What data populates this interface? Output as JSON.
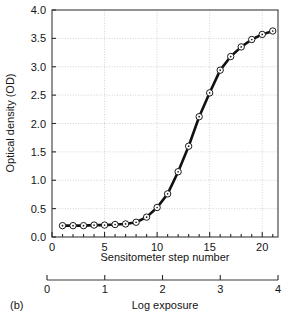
{
  "panel": {
    "label": "(b)"
  },
  "chart_data": {
    "type": "line",
    "title": "",
    "subtitle": "",
    "xlabel": "Sensitometer step number",
    "ylabel": "Optical density (OD)",
    "secondary_xlabel": "Log exposure",
    "xlim": [
      0,
      21.5
    ],
    "ylim": [
      0,
      4.0
    ],
    "secondary_xlim": [
      0,
      4
    ],
    "grid": true,
    "grid_style": "dotted",
    "grid_color": "#c8c8c8",
    "legend": false,
    "legend_position": "none",
    "marker": "circle-with-center-dot",
    "marker_facecolor": "#ffffff",
    "marker_edgecolor": "#1a1a1a",
    "line_color": "#111111",
    "line_width": 2.6,
    "y_ticks": [
      0.0,
      0.5,
      1.0,
      1.5,
      2.0,
      2.5,
      3.0,
      3.5,
      4.0
    ],
    "y_tick_labels": [
      "0.0",
      "0.5",
      "1.0",
      "1.5",
      "2.0",
      "2.5",
      "3.0",
      "3.5",
      "4.0"
    ],
    "x_ticks": [
      0,
      5,
      10,
      15,
      20
    ],
    "x_tick_labels": [
      "0",
      "5",
      "10",
      "15",
      "20"
    ],
    "x_minor_tick_interval": 1,
    "secondary_x_ticks": [
      0,
      1,
      2,
      3,
      4
    ],
    "secondary_x_tick_labels": [
      "0",
      "1",
      "2",
      "3",
      "4"
    ],
    "x": [
      1,
      2,
      3,
      4,
      5,
      6,
      7,
      8,
      9,
      10,
      11,
      12,
      13,
      14,
      15,
      16,
      17,
      18,
      19,
      20,
      21
    ],
    "values": [
      0.2,
      0.2,
      0.2,
      0.21,
      0.21,
      0.22,
      0.23,
      0.26,
      0.35,
      0.52,
      0.76,
      1.15,
      1.6,
      2.12,
      2.54,
      2.94,
      3.18,
      3.35,
      3.48,
      3.57,
      3.63
    ],
    "series": [
      {
        "name": "Characteristic curve",
        "values": [
          0.2,
          0.2,
          0.2,
          0.21,
          0.21,
          0.22,
          0.23,
          0.26,
          0.35,
          0.52,
          0.76,
          1.15,
          1.6,
          2.12,
          2.54,
          2.94,
          3.18,
          3.35,
          3.48,
          3.57,
          3.63
        ]
      }
    ]
  }
}
